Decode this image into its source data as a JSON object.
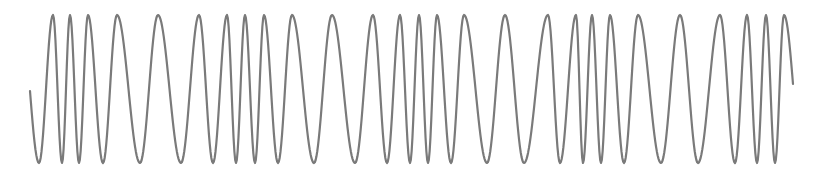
{
  "chart_data": {
    "type": "line",
    "title": "",
    "xlabel": "",
    "ylabel": "",
    "grid": false,
    "legend": "none",
    "description": "Frequency-modulated sinusoid: a constant-amplitude wave whose local frequency varies along the x axis",
    "style": {
      "stroke": "#7a7a7a",
      "stroke_width": 2.2,
      "background": "#ffffff"
    },
    "pixel_frame": {
      "width": 819,
      "height": 171,
      "y_peak": 15,
      "y_trough": 163
    },
    "start_point": {
      "x": 30,
      "y": 91
    },
    "end_point": {
      "x": 793,
      "y": 84
    },
    "extrema": [
      {
        "x": 39,
        "type": "trough"
      },
      {
        "x": 53,
        "type": "peak"
      },
      {
        "x": 62,
        "type": "trough"
      },
      {
        "x": 70,
        "type": "peak"
      },
      {
        "x": 79,
        "type": "trough"
      },
      {
        "x": 88,
        "type": "peak"
      },
      {
        "x": 103,
        "type": "trough"
      },
      {
        "x": 117,
        "type": "peak"
      },
      {
        "x": 140,
        "type": "trough"
      },
      {
        "x": 158,
        "type": "peak"
      },
      {
        "x": 181,
        "type": "trough"
      },
      {
        "x": 199,
        "type": "peak"
      },
      {
        "x": 213,
        "type": "trough"
      },
      {
        "x": 227,
        "type": "peak"
      },
      {
        "x": 236,
        "type": "trough"
      },
      {
        "x": 245,
        "type": "peak"
      },
      {
        "x": 255,
        "type": "trough"
      },
      {
        "x": 264,
        "type": "peak"
      },
      {
        "x": 278,
        "type": "trough"
      },
      {
        "x": 292,
        "type": "peak"
      },
      {
        "x": 314,
        "type": "trough"
      },
      {
        "x": 332,
        "type": "peak"
      },
      {
        "x": 355,
        "type": "trough"
      },
      {
        "x": 373,
        "type": "peak"
      },
      {
        "x": 387,
        "type": "trough"
      },
      {
        "x": 400,
        "type": "peak"
      },
      {
        "x": 410,
        "type": "trough"
      },
      {
        "x": 419,
        "type": "peak"
      },
      {
        "x": 428,
        "type": "trough"
      },
      {
        "x": 437,
        "type": "peak"
      },
      {
        "x": 451,
        "type": "trough"
      },
      {
        "x": 464,
        "type": "peak"
      },
      {
        "x": 487,
        "type": "trough"
      },
      {
        "x": 505,
        "type": "peak"
      },
      {
        "x": 524,
        "type": "trough"
      },
      {
        "x": 548,
        "type": "peak"
      },
      {
        "x": 560,
        "type": "trough"
      },
      {
        "x": 576,
        "type": "peak"
      },
      {
        "x": 583,
        "type": "trough"
      },
      {
        "x": 592,
        "type": "peak"
      },
      {
        "x": 601,
        "type": "trough"
      },
      {
        "x": 610,
        "type": "peak"
      },
      {
        "x": 624,
        "type": "trough"
      },
      {
        "x": 638,
        "type": "peak"
      },
      {
        "x": 661,
        "type": "trough"
      },
      {
        "x": 680,
        "type": "peak"
      },
      {
        "x": 698,
        "type": "trough"
      },
      {
        "x": 720,
        "type": "peak"
      },
      {
        "x": 735,
        "type": "trough"
      },
      {
        "x": 747,
        "type": "peak"
      },
      {
        "x": 757,
        "type": "trough"
      },
      {
        "x": 766,
        "type": "peak"
      },
      {
        "x": 775,
        "type": "trough"
      },
      {
        "x": 784,
        "type": "peak"
      }
    ],
    "peak_count": 27,
    "trough_count": 27
  }
}
